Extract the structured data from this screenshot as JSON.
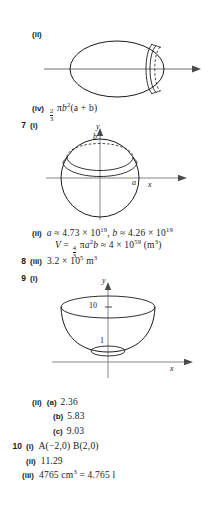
{
  "page": {
    "width": 209,
    "height": 510,
    "background": "#ffffff",
    "ink": "#1a1a1a"
  },
  "entries": [
    {
      "qnum": "",
      "part": "(ii)",
      "subpart": "",
      "answer": ""
    },
    {
      "qnum": "",
      "part": "(iv)",
      "subpart": "",
      "answer": "2/3 πb²(a + b)"
    },
    {
      "qnum": "7",
      "part": "(i)",
      "subpart": "",
      "answer": ""
    },
    {
      "qnum": "",
      "part": "(ii)",
      "subpart": "",
      "answer": "a ≈ 4.73 × 10¹⁹, b ≈ 4.26 × 10¹⁹"
    },
    {
      "qnum": "",
      "part": "",
      "subpart": "",
      "answer": "V = 4/3 πa²b ≈ 4 × 10⁵⁹ (m³)"
    },
    {
      "qnum": "8",
      "part": "(iii)",
      "subpart": "",
      "answer": "3.2 × 10⁵ m³"
    },
    {
      "qnum": "9",
      "part": "(i)",
      "subpart": "",
      "answer": ""
    },
    {
      "qnum": "",
      "part": "(ii)",
      "subpart": "(a)",
      "answer": "2.36"
    },
    {
      "qnum": "",
      "part": "",
      "subpart": "(b)",
      "answer": "5.83"
    },
    {
      "qnum": "",
      "part": "",
      "subpart": "(c)",
      "answer": "9.03"
    },
    {
      "qnum": "10",
      "part": "(i)",
      "subpart": "",
      "answer": "A(−2,0) B(2,0)"
    },
    {
      "qnum": "",
      "part": "(ii)",
      "subpart": "",
      "answer": "11.29"
    },
    {
      "qnum": "",
      "part": "(iii)",
      "subpart": "",
      "answer": "4765 cm³ = 4.765 l"
    }
  ],
  "labels": {
    "q2_ii_part": "(ii)",
    "q2_iv_part": "(iv)",
    "q2_iv_frac_num": "2",
    "q2_iv_frac_den": "3",
    "q2_iv_pi": "π",
    "q2_iv_b": "b",
    "q2_iv_b_exp": "2",
    "q2_iv_tail": "(a + b)",
    "q7_num": "7",
    "q7_i_part": "(i)",
    "q7_ii_part": "(ii)",
    "q7_ii_a_var": "a",
    "q7_ii_approx1": "≈ 4.73 × 10",
    "q7_ii_exp1": "19",
    "q7_ii_comma": ", ",
    "q7_ii_b_var": "b",
    "q7_ii_approx2": "≈ 4.26 × 10",
    "q7_ii_exp2": "19",
    "q7_V_var": "V",
    "q7_V_eq": "= ",
    "q7_V_frac_num": "4",
    "q7_V_frac_den": "3",
    "q7_V_pi": "π",
    "q7_V_a": "a",
    "q7_V_a_exp": "2",
    "q7_V_b": "b",
    "q7_V_approx": "≈ 4 × 10",
    "q7_V_exp": "59",
    "q7_V_units": "(m",
    "q7_V_units_exp": "3",
    "q7_V_units_close": ")",
    "q8_num": "8",
    "q8_part": "(iii)",
    "q8_value": "3.2 × 10",
    "q8_exp": "5",
    "q8_unit": "m",
    "q8_unit_exp": "3",
    "q9_num": "9",
    "q9_i_part": "(i)",
    "q9_ii_part": "(ii)",
    "q9_a_label": "(a)",
    "q9_a_value": "2.36",
    "q9_b_label": "(b)",
    "q9_b_value": "5.83",
    "q9_c_label": "(c)",
    "q9_c_value": "9.03",
    "q10_num": "10",
    "q10_i_part": "(i)",
    "q10_i_value": "A(−2,0) B(2,0)",
    "q10_ii_part": "(ii)",
    "q10_ii_value": "11.29",
    "q10_iii_part": "(iii)",
    "q10_iii_value_num": "4765 cm",
    "q10_iii_value_exp": "3",
    "q10_iii_value_rest": "= 4.765 l"
  },
  "figures": {
    "ellipsoid": {
      "name": "ellipsoid-with-slice-diagram",
      "axis_label": ""
    },
    "sphere": {
      "name": "sphere-cap-diagram",
      "y_axis": "y",
      "x_axis": "x",
      "height_label": "b",
      "radius_label": "a"
    },
    "paraboloid": {
      "name": "paraboloid-bowl-diagram",
      "y_axis": "y",
      "x_axis": "x",
      "top_tick": "10",
      "bottom_tick": "1"
    }
  }
}
